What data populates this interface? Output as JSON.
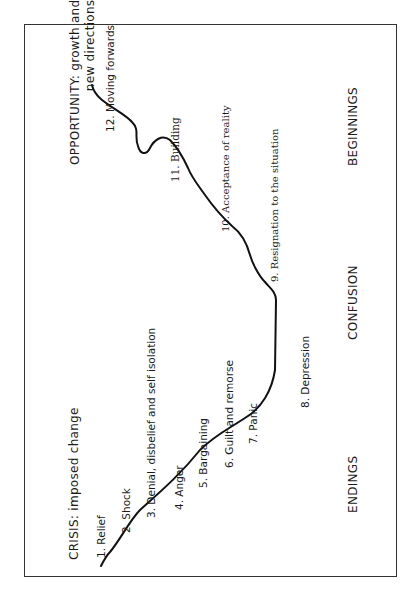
{
  "diagram": {
    "type": "change-transition-curve",
    "phases": {
      "start": "CRISIS: imposed change",
      "end": "OPPORTUNITY: growth and\nnew directions"
    },
    "zones": [
      "ENDINGS",
      "CONFUSION",
      "BEGINNINGS"
    ],
    "stages": [
      {
        "n": 1,
        "label": "1. Relief"
      },
      {
        "n": 2,
        "label": "2. Shock"
      },
      {
        "n": 3,
        "label": "3. Denial, disbelief and self isolation"
      },
      {
        "n": 4,
        "label": "4. Anger"
      },
      {
        "n": 5,
        "label": "5. Bargaining"
      },
      {
        "n": 6,
        "label": "6. Guilt and remorse"
      },
      {
        "n": 7,
        "label": "7. Panic"
      },
      {
        "n": 8,
        "label": "8. Depression"
      },
      {
        "n": 9,
        "label": "9. Resignation to the situation"
      },
      {
        "n": 10,
        "label": "10. Acceptance of reality"
      },
      {
        "n": 11,
        "label": "11. Building"
      },
      {
        "n": 12,
        "label": "12. Moving forwards"
      }
    ],
    "colors": {
      "line": "#111111",
      "frame": "#333333",
      "background": "#ffffff"
    }
  }
}
